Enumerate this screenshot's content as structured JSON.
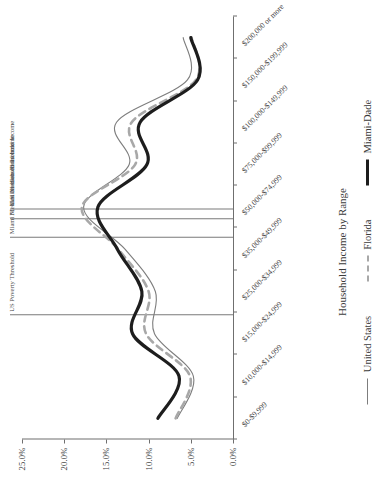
{
  "chart_data": {
    "type": "line",
    "title": "",
    "xlabel": "Household Income by Range",
    "ylabel": "",
    "ylim": [
      0,
      25
    ],
    "ytick_labels": [
      "0.0%",
      "5.0%",
      "10.0%",
      "15.0%",
      "20.0%",
      "25.0%"
    ],
    "ytick_values": [
      0,
      5,
      10,
      15,
      20,
      25
    ],
    "grid": false,
    "legend_position": "bottom",
    "categories": [
      "$0-$9,999",
      "$10,000-$14,999",
      "$15,000-$24,999",
      "$25,000-$34,999",
      "$35,000-$49,999",
      "$50,000-$74,999",
      "$75,000-$99,999",
      "$100,000-$149,999",
      "$150,000-$199,999",
      "$200,000 or more"
    ],
    "series": [
      {
        "name": "United States",
        "style": "thin-solid",
        "color": "#7d7d7d",
        "values": [
          6.6,
          4.7,
          9.3,
          9.2,
          12.8,
          17.7,
          12.3,
          13.8,
          5.4,
          5.9
        ]
      },
      {
        "name": "Florida",
        "style": "dashed",
        "color": "#a8a8a8",
        "values": [
          6.8,
          5.1,
          10.3,
          10.0,
          13.6,
          17.9,
          11.6,
          12.0,
          4.4,
          4.9
        ]
      },
      {
        "name": "Miami-Dade",
        "style": "thick-solid",
        "color": "#1d1d1d",
        "values": [
          8.9,
          6.4,
          11.9,
          10.8,
          13.7,
          16.0,
          10.2,
          11.0,
          4.2,
          5.0
        ]
      }
    ],
    "reference_lines": [
      {
        "label": "US Poverty Threshold",
        "category_position": 2.45
      },
      {
        "label": "Miami Median Household Income",
        "category_position": 4.28
      },
      {
        "label": "FL Median Household Income",
        "category_position": 4.72
      },
      {
        "label": "U.S. Median Household Income",
        "category_position": 4.95
      }
    ]
  },
  "legend": {
    "items": [
      {
        "label": "United States"
      },
      {
        "label": "Florida"
      },
      {
        "label": "Miami-Dade"
      }
    ]
  }
}
